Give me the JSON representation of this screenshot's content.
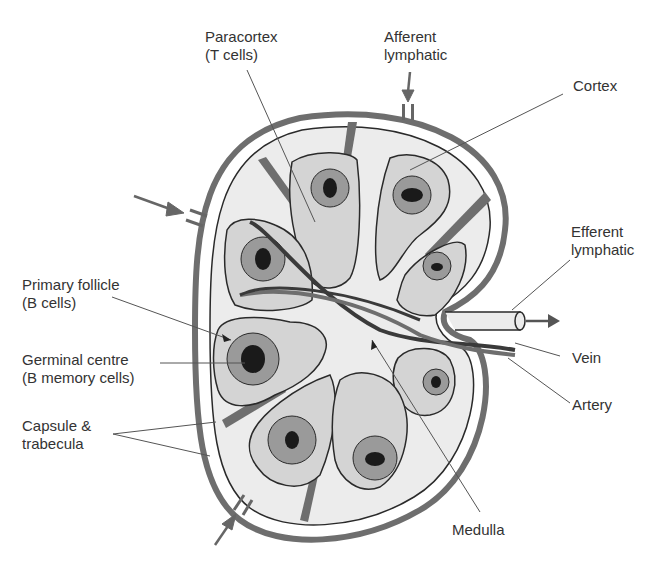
{
  "labels": {
    "paracortex": {
      "line1": "Paracortex",
      "line2": "(T cells)"
    },
    "afferent": {
      "line1": "Afferent",
      "line2": "lymphatic"
    },
    "cortex": {
      "line1": "Cortex"
    },
    "efferent": {
      "line1": "Efferent",
      "line2": "lymphatic"
    },
    "primary_follicle": {
      "line1": "Primary follicle",
      "line2": "(B cells)"
    },
    "germinal_centre": {
      "line1": "Germinal centre",
      "line2": "(B memory cells)"
    },
    "capsule": {
      "line1": "Capsule &",
      "line2": "trabecula"
    },
    "vein": {
      "line1": "Vein"
    },
    "artery": {
      "line1": "Artery"
    },
    "medulla": {
      "line1": "Medulla"
    }
  },
  "colors": {
    "capsule": "#6e6e6e",
    "interior": "#ececec",
    "lobule": "#d4d4d4",
    "follicle_ring": "#9a9a9a",
    "germinal": "#1a1a1a",
    "outline": "#2a2a2a",
    "leader": "#555555",
    "text": "#333333"
  }
}
